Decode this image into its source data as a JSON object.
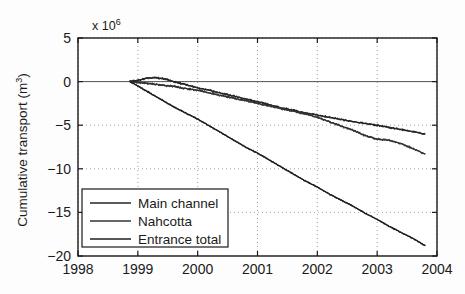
{
  "chart_data": {
    "type": "line",
    "title": "",
    "xlabel": "",
    "ylabel": "Cumulative transport (m",
    "ylabel_sup": "3",
    "ylabel_tail": ")",
    "y_exponent_prefix": "x 10",
    "y_exponent": "6",
    "xlim": [
      1998,
      2004
    ],
    "ylim": [
      -20,
      5
    ],
    "xticks": [
      "1998",
      "1999",
      "2000",
      "2001",
      "2002",
      "2003",
      "2004"
    ],
    "yticks": [
      "5",
      "0",
      "−5",
      "−10",
      "−15",
      "−20"
    ],
    "ytick_values": [
      5,
      0,
      -5,
      -10,
      -15,
      -20
    ],
    "xtick_values": [
      1998,
      1999,
      2000,
      2001,
      2002,
      2003,
      2004
    ],
    "grid": true,
    "grid_style": "dotted",
    "legend_position": "lower-left",
    "series": [
      {
        "name": "Main channel",
        "color": "#262626",
        "x": [
          1998.87,
          1999.0,
          1999.15,
          1999.3,
          1999.45,
          1999.6,
          1999.8,
          2000.0,
          2000.2,
          2000.4,
          2000.6,
          2000.8,
          2001.0,
          2001.2,
          2001.4,
          2001.6,
          2001.8,
          2002.0,
          2002.2,
          2002.4,
          2002.6,
          2002.8,
          2003.0,
          2003.2,
          2003.4,
          2003.6,
          2003.8
        ],
        "y": [
          0.0,
          0.15,
          0.4,
          0.45,
          0.3,
          0.0,
          -0.35,
          -0.7,
          -1.0,
          -1.35,
          -1.65,
          -2.0,
          -2.3,
          -2.65,
          -3.0,
          -3.3,
          -3.6,
          -3.85,
          -4.1,
          -4.35,
          -4.6,
          -4.8,
          -5.0,
          -5.25,
          -5.5,
          -5.75,
          -6.0
        ]
      },
      {
        "name": "Nahcotta",
        "color": "#333333",
        "x": [
          1998.87,
          1999.0,
          1999.15,
          1999.3,
          1999.45,
          1999.6,
          1999.8,
          2000.0,
          2000.2,
          2000.4,
          2000.6,
          2000.8,
          2001.0,
          2001.2,
          2001.4,
          2001.6,
          2001.8,
          2002.0,
          2002.2,
          2002.4,
          2002.6,
          2002.8,
          2003.0,
          2003.2,
          2003.4,
          2003.6,
          2003.8
        ],
        "y": [
          0.0,
          -0.1,
          -0.2,
          -0.3,
          -0.45,
          -0.55,
          -0.8,
          -1.0,
          -1.3,
          -1.6,
          -1.9,
          -2.2,
          -2.5,
          -2.8,
          -3.1,
          -3.4,
          -3.7,
          -4.1,
          -4.6,
          -5.1,
          -5.6,
          -6.2,
          -6.6,
          -6.7,
          -7.1,
          -7.7,
          -8.3
        ]
      },
      {
        "name": "Entrance total",
        "color": "#1f1f1f",
        "x": [
          1998.87,
          1999.0,
          1999.15,
          1999.3,
          1999.45,
          1999.6,
          1999.8,
          2000.0,
          2000.2,
          2000.4,
          2000.6,
          2000.8,
          2001.0,
          2001.2,
          2001.4,
          2001.6,
          2001.8,
          2002.0,
          2002.2,
          2002.4,
          2002.6,
          2002.8,
          2003.0,
          2003.2,
          2003.4,
          2003.6,
          2003.8
        ],
        "y": [
          0.0,
          -0.5,
          -1.1,
          -1.7,
          -2.3,
          -2.9,
          -3.6,
          -4.3,
          -5.1,
          -5.9,
          -6.7,
          -7.5,
          -8.2,
          -9.0,
          -9.8,
          -10.6,
          -11.4,
          -12.1,
          -12.9,
          -13.6,
          -14.3,
          -15.1,
          -15.8,
          -16.6,
          -17.3,
          -18.0,
          -18.8
        ]
      }
    ]
  },
  "legend": {
    "items": [
      {
        "label": "Main channel"
      },
      {
        "label": "Nahcotta"
      },
      {
        "label": "Entrance total"
      }
    ]
  }
}
